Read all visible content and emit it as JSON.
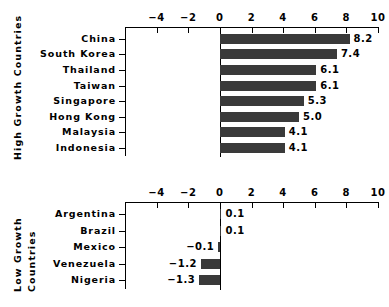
{
  "chart_data": {
    "type": "bar",
    "orientation": "horizontal",
    "title": "",
    "xlabel": "",
    "ylabel": "",
    "xlim": [
      -6,
      10
    ],
    "xticks": [
      -4,
      -2,
      0,
      2,
      4,
      6,
      8,
      10
    ],
    "xticklabels": [
      "−4",
      "−2",
      "0",
      "2",
      "4",
      "6",
      "8",
      "10"
    ],
    "grid": false,
    "legend": false,
    "bar_color": "#3a3a3a",
    "panels": [
      {
        "group_label": "High Growth Countries",
        "categories": [
          "China",
          "South Korea",
          "Thailand",
          "Taiwan",
          "Singapore",
          "Hong Kong",
          "Malaysia",
          "Indonesia"
        ],
        "values": [
          8.2,
          7.4,
          6.1,
          6.1,
          5.3,
          5.0,
          4.1,
          4.1
        ],
        "value_labels": [
          "8.2",
          "7.4",
          "6.1",
          "6.1",
          "5.3",
          "5.0",
          "4.1",
          "4.1"
        ]
      },
      {
        "group_label_lines": [
          "Low Growth",
          "Countries"
        ],
        "group_label": "Low Growth Countries",
        "categories": [
          "Argentina",
          "Brazil",
          "Mexico",
          "Venezuela",
          "Nigeria"
        ],
        "values": [
          0.1,
          0.1,
          -0.1,
          -1.2,
          -1.3
        ],
        "value_labels": [
          "0.1",
          "0.1",
          "−0.1",
          "−1.2",
          "−1.3"
        ]
      }
    ]
  }
}
